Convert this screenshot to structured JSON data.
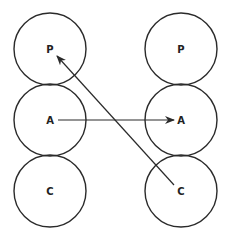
{
  "diagram": {
    "colors": {
      "stroke": "#2a2a2a",
      "background": "#ffffff"
    },
    "left_column": {
      "nodes": [
        {
          "label": "P"
        },
        {
          "label": "A"
        },
        {
          "label": "C"
        }
      ]
    },
    "right_column": {
      "nodes": [
        {
          "label": "P"
        },
        {
          "label": "A"
        },
        {
          "label": "C"
        }
      ]
    },
    "arrows": [
      {
        "from": "left A",
        "to": "right A",
        "direction": "horizontal"
      },
      {
        "from": "right C",
        "to": "left P",
        "direction": "diagonal"
      }
    ]
  }
}
